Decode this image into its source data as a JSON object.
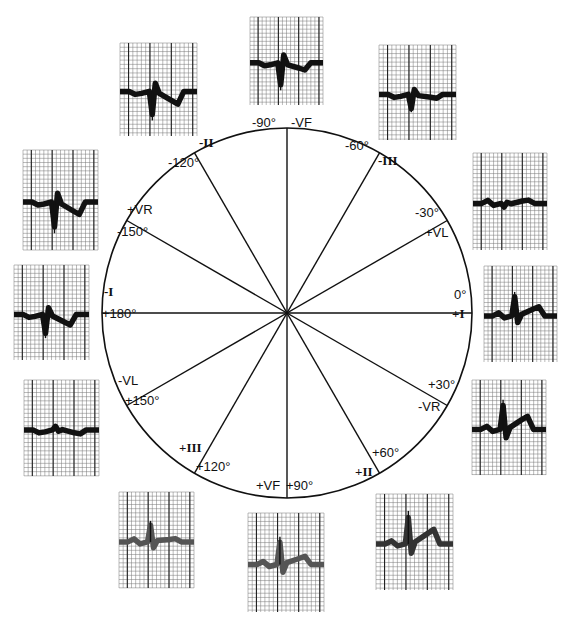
{
  "diagram": {
    "circle": {
      "cx": 287,
      "cy": 313,
      "r": 185
    },
    "axes": [
      {
        "angle": 0,
        "positive": "+I",
        "negative": "-I",
        "deg_pos": "0°",
        "deg_neg": "+180°"
      },
      {
        "angle": 30,
        "positive": "-VR",
        "negative": "+VR",
        "deg_pos": "+30°",
        "deg_neg": "-150°"
      },
      {
        "angle": 60,
        "positive": "+II",
        "negative": "-II",
        "deg_pos": "+60°",
        "deg_neg": "-120°"
      },
      {
        "angle": 90,
        "positive": "+VF",
        "negative": "-VF",
        "deg_pos": "+90°",
        "deg_neg": "-90°"
      },
      {
        "angle": 120,
        "positive": "+III",
        "negative": "-III",
        "deg_pos": "+120°",
        "deg_neg": "-60°"
      },
      {
        "angle": 150,
        "positive": "-VL",
        "negative": "+VL",
        "deg_pos": "+150°",
        "deg_neg": "-30°"
      }
    ],
    "labels": [
      {
        "id": "deg-m90",
        "text": "-90°",
        "x": 252,
        "y": 128,
        "roman": false
      },
      {
        "id": "lead-mvf",
        "text": "-VF",
        "x": 291,
        "y": 128,
        "roman": false
      },
      {
        "id": "lead-mii",
        "text": "-II",
        "x": 199,
        "y": 148,
        "roman": true
      },
      {
        "id": "deg-m120",
        "text": "-120°",
        "x": 168,
        "y": 168,
        "roman": false
      },
      {
        "id": "deg-m60",
        "text": "-60°",
        "x": 345,
        "y": 151,
        "roman": false
      },
      {
        "id": "lead-miii",
        "text": "-III",
        "x": 378,
        "y": 166,
        "roman": true
      },
      {
        "id": "lead-pvr",
        "text": "+VR",
        "x": 127,
        "y": 215,
        "roman": false
      },
      {
        "id": "deg-m150",
        "text": "-150°",
        "x": 117,
        "y": 237,
        "roman": false
      },
      {
        "id": "deg-m30",
        "text": "-30°",
        "x": 415,
        "y": 218,
        "roman": false
      },
      {
        "id": "lead-pvl",
        "text": "+VL",
        "x": 425,
        "y": 238,
        "roman": false
      },
      {
        "id": "lead-mi",
        "text": "-I",
        "x": 104,
        "y": 297,
        "roman": true
      },
      {
        "id": "deg-p180",
        "text": "+180°",
        "x": 102,
        "y": 319,
        "roman": false
      },
      {
        "id": "deg-0",
        "text": "0°",
        "x": 454,
        "y": 300,
        "roman": false
      },
      {
        "id": "lead-pi",
        "text": "+I",
        "x": 452,
        "y": 319,
        "roman": true
      },
      {
        "id": "lead-mvl",
        "text": "-VL",
        "x": 118,
        "y": 386,
        "roman": false
      },
      {
        "id": "deg-p150",
        "text": "+150°",
        "x": 125,
        "y": 406,
        "roman": false
      },
      {
        "id": "deg-p30",
        "text": "+30°",
        "x": 428,
        "y": 390,
        "roman": false
      },
      {
        "id": "lead-mvr",
        "text": "-VR",
        "x": 418,
        "y": 412,
        "roman": false
      },
      {
        "id": "lead-piii",
        "text": "+III",
        "x": 179,
        "y": 453,
        "roman": true
      },
      {
        "id": "deg-p120",
        "text": "+120°",
        "x": 196,
        "y": 472,
        "roman": false
      },
      {
        "id": "deg-p60",
        "text": "+60°",
        "x": 372,
        "y": 458,
        "roman": false
      },
      {
        "id": "lead-pii",
        "text": "+II",
        "x": 355,
        "y": 477,
        "roman": true
      },
      {
        "id": "lead-pvf",
        "text": "+VF",
        "x": 256,
        "y": 491,
        "roman": false
      },
      {
        "id": "deg-p90",
        "text": "+90°",
        "x": 286,
        "y": 491,
        "roman": false
      }
    ],
    "strips": [
      {
        "id": "strip-minus-ii",
        "lead": "-II",
        "x": 120,
        "y": 43,
        "w": 77,
        "h": 93,
        "qrs": -1,
        "t": -1,
        "shade": "#111"
      },
      {
        "id": "strip-minus-vf",
        "lead": "-VF",
        "x": 250,
        "y": 17,
        "w": 73,
        "h": 88,
        "qrs": -1,
        "t": -0.6,
        "shade": "#111"
      },
      {
        "id": "strip-minus-iii",
        "lead": "-III",
        "x": 379,
        "y": 45,
        "w": 77,
        "h": 95,
        "qrs": -0.6,
        "t": -0.3,
        "shade": "#111"
      },
      {
        "id": "strip-plus-vl",
        "lead": "+VL",
        "x": 473,
        "y": 153,
        "w": 74,
        "h": 97,
        "qrs": -0.15,
        "t": 0.25,
        "shade": "#111"
      },
      {
        "id": "strip-plus-i",
        "lead": "+I",
        "x": 484,
        "y": 266,
        "w": 73,
        "h": 96,
        "qrs": 0.8,
        "t": 0.7,
        "shade": "#111"
      },
      {
        "id": "strip-minus-vr",
        "lead": "-VR",
        "x": 472,
        "y": 380,
        "w": 74,
        "h": 95,
        "qrs": 1,
        "t": 1,
        "shade": "#111"
      },
      {
        "id": "strip-plus-ii",
        "lead": "+II",
        "x": 376,
        "y": 494,
        "w": 77,
        "h": 96,
        "qrs": 1.1,
        "t": 1.1,
        "shade": "#333"
      },
      {
        "id": "strip-plus-vf",
        "lead": "+VF",
        "x": 248,
        "y": 513,
        "w": 76,
        "h": 99,
        "qrs": 0.9,
        "t": 0.6,
        "shade": "#555"
      },
      {
        "id": "strip-plus-iii",
        "lead": "+III",
        "x": 119,
        "y": 492,
        "w": 75,
        "h": 96,
        "qrs": 0.7,
        "t": 0.25,
        "shade": "#555"
      },
      {
        "id": "strip-minus-vl",
        "lead": "-VL",
        "x": 24,
        "y": 380,
        "w": 75,
        "h": 96,
        "qrs": 0.15,
        "t": -0.3,
        "shade": "#111"
      },
      {
        "id": "strip-minus-i",
        "lead": "-I",
        "x": 14,
        "y": 265,
        "w": 75,
        "h": 95,
        "qrs": -0.8,
        "t": -0.8,
        "shade": "#111"
      },
      {
        "id": "strip-plus-vr",
        "lead": "+VR",
        "x": 23,
        "y": 150,
        "w": 75,
        "h": 100,
        "qrs": -1,
        "t": -0.9,
        "shade": "#111"
      }
    ]
  }
}
